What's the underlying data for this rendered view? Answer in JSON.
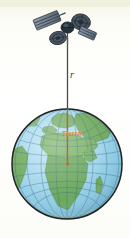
{
  "figure": {
    "background_color": "#fbfbf3",
    "width": 130,
    "height": 238
  },
  "labels": {
    "radius": "r",
    "center_annotation": "Tierra"
  },
  "satellite": {
    "name": "satellite",
    "body_color": "#2e3b48",
    "panel_color": "#6d7b88",
    "dish_color": "#4a5a69",
    "mast_color": "#555555",
    "parts": [
      "solar-panel-upper-left",
      "dish-antenna-right",
      "dish-antenna-lower-left",
      "satellite-body",
      "satellite-mast"
    ]
  },
  "radius_line": {
    "name": "radius-line",
    "outer_color": "#4a4a4a",
    "inner_color": "#d4681a",
    "top_y": 40,
    "globe_surface_y": 110,
    "center_y": 164,
    "x": 67.5
  },
  "globe": {
    "name": "earth-globe",
    "center_x": 67,
    "center_y": 164,
    "radius": 55,
    "ocean_color": "#9fd4ea",
    "ocean_deep_color": "#6fb9d9",
    "land_color": "#7ab06a",
    "land_dark_color": "#5c9450",
    "outline_color": "#2b2b2b",
    "grid_color": "#3a6f86",
    "continents": [
      "Europe",
      "Africa",
      "Asia",
      "South America"
    ],
    "graticule": {
      "meridians": 9,
      "parallels": 9
    }
  }
}
